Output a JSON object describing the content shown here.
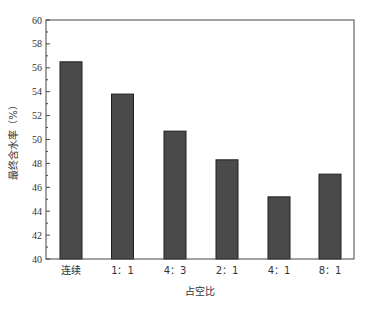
{
  "chart_data": {
    "type": "bar",
    "title": "",
    "xlabel": "占空比",
    "ylabel": "最终含水率（%）",
    "categories": [
      "连续",
      "1：1",
      "4：3",
      "2：1",
      "4：1",
      "8：1"
    ],
    "values": [
      56.5,
      53.8,
      50.7,
      48.3,
      45.2,
      47.1
    ],
    "ylim": [
      40,
      60
    ],
    "yticks": [
      40,
      42,
      44,
      46,
      48,
      50,
      52,
      54,
      56,
      58,
      60
    ],
    "y_minor_step": 1,
    "grid": false,
    "legend": null,
    "bar_color": "#4a4a4a",
    "bar_edge_color": "#1e1e1e"
  },
  "labels": {
    "xlabel": "占空比",
    "ylabel": "最终含水率（%）"
  }
}
